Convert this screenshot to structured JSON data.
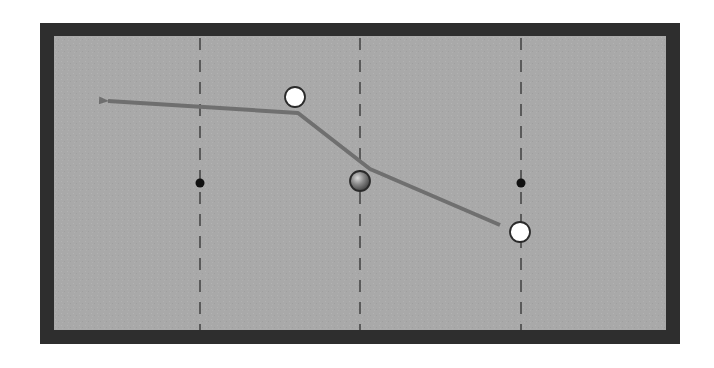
{
  "diagram": {
    "type": "billiards-shot-diagram",
    "table": {
      "rail_color": "#2e2e2e",
      "felt_color": "#a9a9a9",
      "outer": {
        "x": 40,
        "y": 23,
        "width": 640,
        "height": 321
      },
      "felt": {
        "x": 54,
        "y": 36,
        "width": 612,
        "height": 294
      }
    },
    "diamond_lines": {
      "color": "#5a5a5a",
      "x_positions": [
        200,
        360,
        521
      ]
    },
    "center_spots": [
      {
        "x": 200,
        "y": 183
      },
      {
        "x": 521,
        "y": 183
      }
    ],
    "balls": [
      {
        "id": "white-ball-top",
        "x": 295,
        "y": 97,
        "r": 10,
        "fill": "#ffffff"
      },
      {
        "id": "object-ball-center",
        "x": 360,
        "y": 181,
        "r": 10,
        "fill": "#7a7a7a"
      },
      {
        "id": "white-ball-right",
        "x": 520,
        "y": 232,
        "r": 10,
        "fill": "#ffffff"
      }
    ],
    "path": {
      "color": "#6f6f6f",
      "points": [
        [
          500,
          225
        ],
        [
          370,
          169
        ],
        [
          298,
          113
        ],
        [
          108,
          101
        ]
      ],
      "arrow_at": "end"
    }
  }
}
